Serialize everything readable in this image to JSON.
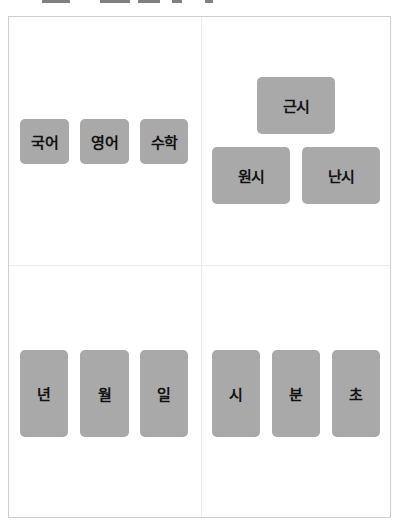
{
  "colors": {
    "card_bg": "#a9a9a9",
    "card_text": "#111111",
    "border": "#cfcfcf",
    "divider": "#ececec"
  },
  "quadrants": {
    "top_left": {
      "cards": [
        {
          "label": "국어"
        },
        {
          "label": "영어"
        },
        {
          "label": "수학"
        }
      ]
    },
    "top_right": {
      "cards": [
        {
          "label": "근시"
        },
        {
          "label": "원시"
        },
        {
          "label": "난시"
        }
      ]
    },
    "bottom_left": {
      "cards": [
        {
          "label": "년"
        },
        {
          "label": "월"
        },
        {
          "label": "일"
        }
      ]
    },
    "bottom_right": {
      "cards": [
        {
          "label": "시"
        },
        {
          "label": "분"
        },
        {
          "label": "초"
        }
      ]
    }
  }
}
